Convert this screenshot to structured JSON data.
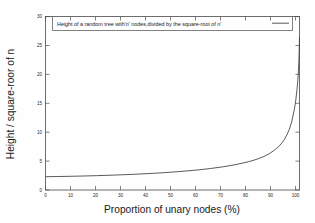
{
  "chart_data": {
    "type": "line",
    "title": "",
    "xlabel": "Proportion of unary nodes (%)",
    "ylabel": "Height / square-roor of n",
    "xlim": [
      0,
      100
    ],
    "ylim": [
      0,
      30
    ],
    "grid": false,
    "legend_position": "top-inside",
    "series": [
      {
        "name": "Height of a random tree with'n' nodes,divided by the square-root of n'",
        "x": [
          0,
          5,
          10,
          15,
          20,
          25,
          30,
          35,
          40,
          45,
          50,
          55,
          60,
          65,
          70,
          75,
          80,
          82,
          84,
          86,
          88,
          90,
          91,
          92,
          93,
          94,
          95,
          96,
          97,
          98,
          98.5,
          99,
          99.3,
          99.5,
          99.7,
          99.85,
          99.95,
          100
        ],
        "values": [
          2.3,
          2.33,
          2.37,
          2.42,
          2.48,
          2.55,
          2.63,
          2.72,
          2.83,
          2.95,
          3.1,
          3.27,
          3.47,
          3.72,
          4.02,
          4.4,
          4.9,
          5.15,
          5.45,
          5.8,
          6.25,
          6.85,
          7.2,
          7.6,
          8.1,
          8.7,
          9.5,
          10.5,
          11.9,
          14.0,
          15.4,
          17.3,
          18.8,
          20.0,
          21.8,
          23.5,
          25.5,
          26.5
        ]
      }
    ],
    "xticks": [
      0,
      10,
      20,
      30,
      40,
      50,
      60,
      70,
      80,
      90,
      100
    ],
    "yticks": [
      0,
      5,
      10,
      15,
      20,
      25,
      30
    ],
    "curve_color": "#3c3c3c",
    "frame_color": "#4a4a4a",
    "background_color": "#fefefe"
  },
  "axes": {
    "x_title": "Proportion of unary nodes (%)",
    "y_title": "Height / square-roor of n"
  },
  "legend": {
    "entry_label": "Height of a random tree with'n' nodes,divided by the square-root of n'"
  }
}
